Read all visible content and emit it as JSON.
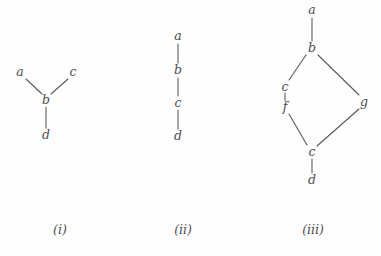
{
  "figure": {
    "background_color": "#fefefe",
    "ink_color": "#4d4d52",
    "edge_color": "#55555a",
    "width": 381,
    "height": 256
  },
  "panels": [
    {
      "id": "i",
      "caption": "(i)",
      "caption_x": 60,
      "caption_y": 222,
      "origin_x": 0,
      "nodes": [
        {
          "id": "a",
          "label": "a",
          "x": 20,
          "y": 72
        },
        {
          "id": "c",
          "label": "c",
          "x": 73,
          "y": 72
        },
        {
          "id": "b",
          "label": "b",
          "x": 46,
          "y": 100
        },
        {
          "id": "d",
          "label": "d",
          "x": 46,
          "y": 135
        }
      ],
      "edges": [
        {
          "from": "a",
          "to": "b",
          "x1": 26,
          "y1": 79,
          "x2": 42,
          "y2": 94
        },
        {
          "from": "c",
          "to": "b",
          "x1": 68,
          "y1": 79,
          "x2": 51,
          "y2": 94
        },
        {
          "from": "b",
          "to": "d",
          "x1": 46,
          "y1": 107,
          "x2": 46,
          "y2": 128
        }
      ]
    },
    {
      "id": "ii",
      "caption": "(ii)",
      "caption_x": 183,
      "caption_y": 222,
      "origin_x": 125,
      "nodes": [
        {
          "id": "a",
          "label": "a",
          "x": 178,
          "y": 36
        },
        {
          "id": "b",
          "label": "b",
          "x": 178,
          "y": 70
        },
        {
          "id": "c",
          "label": "c",
          "x": 178,
          "y": 103
        },
        {
          "id": "d",
          "label": "d",
          "x": 178,
          "y": 136
        }
      ],
      "edges": [
        {
          "from": "a",
          "to": "b",
          "x1": 178,
          "y1": 44,
          "x2": 178,
          "y2": 63
        },
        {
          "from": "b",
          "to": "c",
          "x1": 178,
          "y1": 78,
          "x2": 178,
          "y2": 96
        },
        {
          "from": "c",
          "to": "d",
          "x1": 178,
          "y1": 110,
          "x2": 178,
          "y2": 129
        }
      ]
    },
    {
      "id": "iii",
      "caption": "(iii)",
      "caption_x": 313,
      "caption_y": 222,
      "origin_x": 245,
      "nodes": [
        {
          "id": "a",
          "label": "a",
          "x": 312,
          "y": 10
        },
        {
          "id": "b",
          "label": "b",
          "x": 312,
          "y": 48
        },
        {
          "id": "c_left",
          "label": "c",
          "x": 285,
          "y": 87
        },
        {
          "id": "f",
          "label": "f",
          "x": 285,
          "y": 107
        },
        {
          "id": "g",
          "label": "g",
          "x": 364,
          "y": 102
        },
        {
          "id": "c_bot",
          "label": "c",
          "x": 312,
          "y": 152
        },
        {
          "id": "d",
          "label": "d",
          "x": 312,
          "y": 180
        }
      ],
      "edges": [
        {
          "from": "a",
          "to": "b",
          "x1": 312,
          "y1": 18,
          "x2": 312,
          "y2": 41
        },
        {
          "from": "b",
          "to": "c_left",
          "x1": 306,
          "y1": 55,
          "x2": 289,
          "y2": 80
        },
        {
          "from": "b",
          "to": "g",
          "x1": 318,
          "y1": 55,
          "x2": 359,
          "y2": 95
        },
        {
          "from": "c_left",
          "to": "f",
          "x1": 285,
          "y1": 93,
          "x2": 285,
          "y2": 101
        },
        {
          "from": "f",
          "to": "c_bot",
          "x1": 289,
          "y1": 114,
          "x2": 307,
          "y2": 145
        },
        {
          "from": "g",
          "to": "c_bot",
          "x1": 359,
          "y1": 109,
          "x2": 317,
          "y2": 146
        },
        {
          "from": "c_bot",
          "to": "d",
          "x1": 312,
          "y1": 159,
          "x2": 312,
          "y2": 173
        }
      ]
    }
  ]
}
